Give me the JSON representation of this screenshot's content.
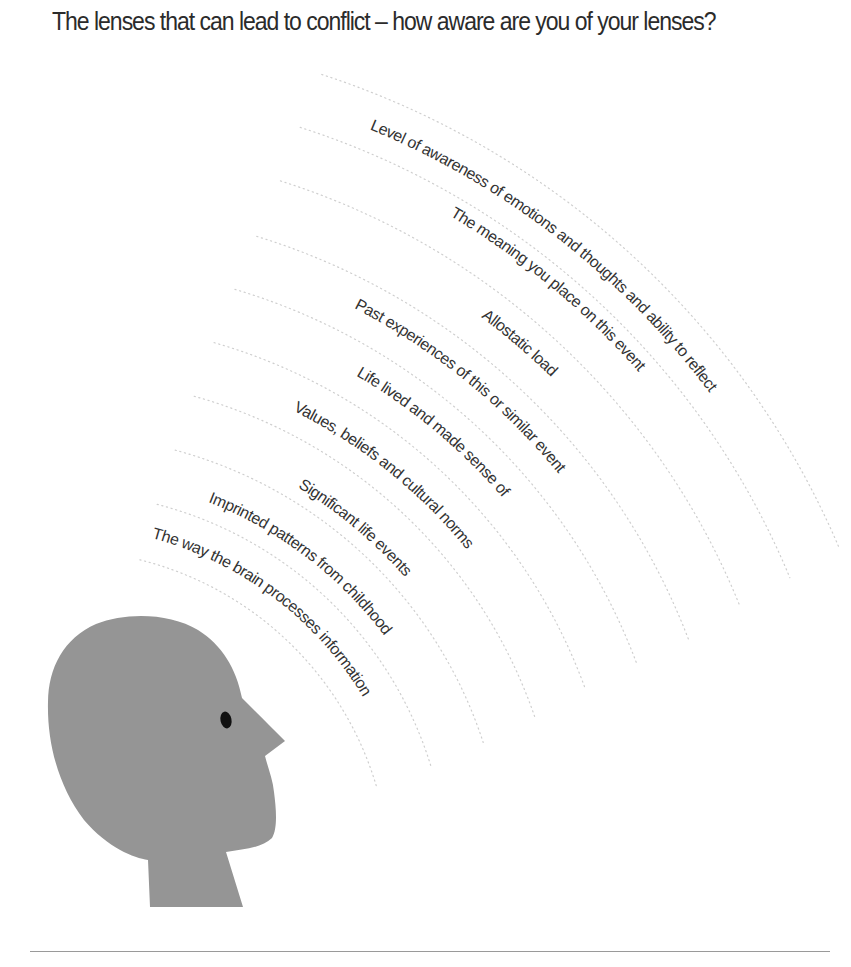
{
  "title": "The lenses that can lead to conflict – how aware are you of your lenses?",
  "diagram": {
    "center": [
      60,
      880
    ],
    "colors": {
      "head": "#959595",
      "eye": "#111111",
      "text": "#333333",
      "arcs": "#cfcfcf",
      "rule": "#9a9a9a"
    },
    "arcs": [
      {
        "r": 330,
        "start_deg": 76,
        "end_deg": 16
      },
      {
        "r": 388,
        "start_deg": 75.5,
        "end_deg": 17
      },
      {
        "r": 445,
        "start_deg": 75,
        "end_deg": 18
      },
      {
        "r": 502,
        "start_deg": 74.5,
        "end_deg": 19
      },
      {
        "r": 559,
        "start_deg": 74,
        "end_deg": 20
      },
      {
        "r": 616,
        "start_deg": 73.5,
        "end_deg": 20.5
      },
      {
        "r": 673,
        "start_deg": 73,
        "end_deg": 21
      },
      {
        "r": 733,
        "start_deg": 72.5,
        "end_deg": 22
      },
      {
        "r": 790,
        "start_deg": 72.3,
        "end_deg": 22.5
      },
      {
        "r": 847,
        "start_deg": 72,
        "end_deg": 23
      }
    ],
    "lenses": [
      {
        "id": "awareness",
        "text": "Level of awareness of emotions and thoughts and ability to reflect",
        "r": 812,
        "start_deg": 67.6
      },
      {
        "id": "meaning",
        "text": "The meaning you place on this event",
        "r": 770,
        "start_deg": 59.6
      },
      {
        "id": "allostatic",
        "text": "Allostatic load",
        "r": 703,
        "start_deg": 53.2
      },
      {
        "id": "past-experiences",
        "text": "Past experiences of this or similar event",
        "r": 643,
        "start_deg": 62.8
      },
      {
        "id": "life-lived",
        "text": "Life lived and made sense of",
        "r": 585,
        "start_deg": 59.6
      },
      {
        "id": "values",
        "text": "Values, beliefs and cultural norms",
        "r": 524,
        "start_deg": 63.6
      },
      {
        "id": "significant-events",
        "text": "Significant life events",
        "r": 459,
        "start_deg": 58.8
      },
      {
        "id": "imprinted-patterns",
        "text": "Imprinted patterns from childhood",
        "r": 406,
        "start_deg": 68.6
      },
      {
        "id": "brain-processing",
        "text": "The way the brain processes information",
        "r": 354,
        "start_deg": 75.0
      }
    ],
    "figure": {
      "description": "Grey silhouette of a human head in profile facing right",
      "eye_center": [
        226,
        720
      ]
    }
  }
}
